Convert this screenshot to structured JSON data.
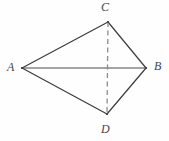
{
  "figure": {
    "background_color": "#fefefe",
    "stroke_color": "#3c3c3c",
    "dash_color": "#8c8c8c",
    "label_color": "#444444",
    "width": 169,
    "height": 141,
    "vertices": [
      {
        "name": "A",
        "label": "A",
        "x": 22,
        "y": 68
      },
      {
        "name": "B",
        "label": "B",
        "x": 146,
        "y": 68
      },
      {
        "name": "C",
        "label": "C",
        "x": 108,
        "y": 22
      },
      {
        "name": "D",
        "label": "D",
        "x": 107,
        "y": 114
      }
    ],
    "edges": [
      {
        "name": "segment-AC",
        "from": "A",
        "to": "C",
        "style": "solid"
      },
      {
        "name": "segment-CB",
        "from": "C",
        "to": "B",
        "style": "solid"
      },
      {
        "name": "segment-AD",
        "from": "A",
        "to": "D",
        "style": "solid"
      },
      {
        "name": "segment-DB",
        "from": "D",
        "to": "B",
        "style": "solid"
      },
      {
        "name": "diagonal-AB",
        "from": "A",
        "to": "B",
        "style": "solid"
      },
      {
        "name": "diagonal-CD",
        "from": "C",
        "to": "D",
        "style": "dashed"
      }
    ]
  }
}
